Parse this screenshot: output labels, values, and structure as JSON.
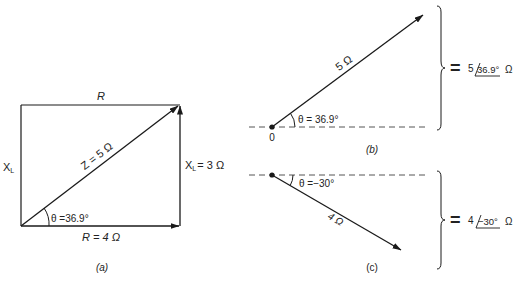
{
  "panel_a": {
    "label": "(a)",
    "top_label": "R",
    "left_label": "X",
    "left_label_sub": "L",
    "hypotenuse_label": "Z = 5 Ω",
    "right_label": "X",
    "right_label_sub": "L",
    "right_label_value": "= 3 Ω",
    "bottom_label": "R = 4 Ω",
    "angle_label": "θ =36.9°"
  },
  "panel_b": {
    "label": "(b)",
    "origin_label": "0",
    "vector_label": "5 Ω",
    "angle_label": "θ = 36.9°",
    "equals": "=",
    "polar_magnitude": "5",
    "polar_angle": "36.9°",
    "polar_unit": "Ω"
  },
  "panel_c": {
    "label": "(c)",
    "vector_label": "4 Ω",
    "angle_label": "θ =−30°",
    "equals": "=",
    "polar_magnitude": "4",
    "polar_angle": "−30°",
    "polar_unit": "Ω"
  },
  "colors": {
    "line": "#1a1a1a",
    "dash": "#555555",
    "background": "#ffffff"
  }
}
